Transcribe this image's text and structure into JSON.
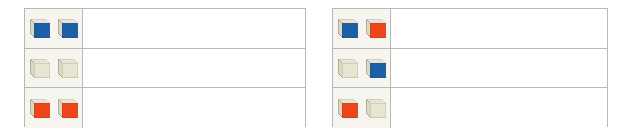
{
  "colors": {
    "cube_blue": "#1a5fa8",
    "cube_blue_dark": "#144c87",
    "cube_red": "#ee4618",
    "cube_red_dark": "#c63811",
    "cube_cream": "#e9e5d3",
    "cube_cream_dark": "#cfcab2",
    "cube_side": "#ddd8c2",
    "cube_bottom": "#c8c2aa",
    "cube_outline": "#8e8874",
    "table_border": "#b9b9b4",
    "icon_cell_bg": "#f6f5ef",
    "content_cell_bg": "#ffffff",
    "page_bg": "#ffffff"
  },
  "tables": [
    {
      "id": "left-table",
      "name": "left-cube-table",
      "rows": [
        {
          "id": "row-1",
          "cubes": [
            "blue",
            "blue"
          ],
          "content": ""
        },
        {
          "id": "row-2",
          "cubes": [
            "cream",
            "cream"
          ],
          "content": ""
        },
        {
          "id": "row-3",
          "cubes": [
            "red",
            "red"
          ],
          "content": ""
        }
      ]
    },
    {
      "id": "right-table",
      "name": "right-cube-table",
      "rows": [
        {
          "id": "row-1",
          "cubes": [
            "blue",
            "red"
          ],
          "content": ""
        },
        {
          "id": "row-2",
          "cubes": [
            "cream",
            "blue"
          ],
          "content": ""
        },
        {
          "id": "row-3",
          "cubes": [
            "red",
            "cream"
          ],
          "content": ""
        }
      ]
    }
  ]
}
